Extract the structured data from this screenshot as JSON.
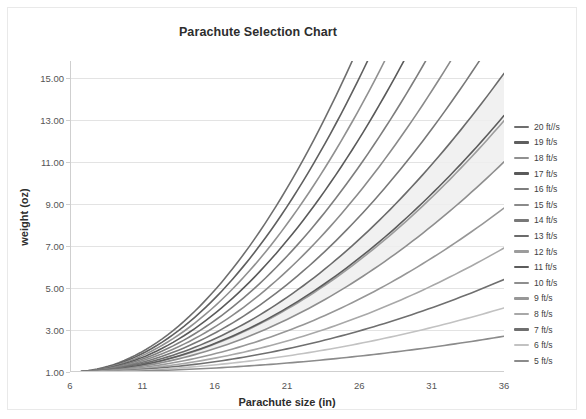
{
  "chart": {
    "title": "Parachute Selection Chart",
    "xlabel": "Parachute size (in)",
    "ylabel": "weight (oz)"
  },
  "chart_data": {
    "type": "line",
    "title": "Parachute Selection Chart",
    "subtitle": "",
    "xlabel": "Parachute size (in)",
    "ylabel": "weight (oz)",
    "xlim": [
      6,
      36
    ],
    "ylim": [
      1.0,
      15.8
    ],
    "xticks": [
      6,
      11,
      16,
      21,
      26,
      31,
      36
    ],
    "xtick_labels": [
      "6",
      "11",
      "16",
      "21",
      "26",
      "31",
      "36"
    ],
    "yticks": [
      1.0,
      3.0,
      5.0,
      7.0,
      9.0,
      11.0,
      13.0,
      15.0
    ],
    "ytick_labels": [
      "1.00",
      "3.00",
      "5.00",
      "7.00",
      "9.00",
      "11.00",
      "13.00",
      "15.00"
    ],
    "grid": "horizontal",
    "legend_position": "right",
    "annotations": [
      {
        "type": "shaded-band",
        "label": "recommended range",
        "color": "#efefef"
      }
    ],
    "x": [
      6,
      8,
      10,
      12,
      14,
      16,
      18,
      20,
      22,
      24,
      26,
      28,
      30,
      32,
      34,
      36
    ],
    "series": [
      {
        "name": "20 ft//s",
        "color": "#6e6e6e",
        "endpoint_y": 36.0,
        "values": [
          1.0,
          1.78,
          2.78,
          4.0,
          5.44,
          7.11,
          9.0,
          11.11,
          13.44,
          16.0,
          18.78,
          21.78,
          25.0,
          28.44,
          32.11,
          36.0
        ]
      },
      {
        "name": "19 ft/s",
        "color": "#5f5f5f",
        "endpoint_y": 32.49,
        "values": [
          1.0,
          1.78,
          2.78,
          4.0,
          5.44,
          7.11,
          9.0,
          11.11,
          13.44,
          16.0,
          18.78,
          21.78,
          25.0,
          28.44,
          32.11,
          36.0
        ]
      },
      {
        "name": "18 ft/s",
        "color": "#909090",
        "endpoint_y": 29.16,
        "values": [
          1.0,
          1.78,
          2.78,
          4.0,
          5.44,
          7.11,
          9.0,
          11.11,
          13.44,
          16.0,
          18.78,
          21.78,
          25.0,
          28.44,
          32.11,
          36.0
        ]
      },
      {
        "name": "17 ft/s",
        "color": "#5a5a5a",
        "endpoint_y": 26.01,
        "values": [
          1.0,
          1.78,
          2.78,
          4.0,
          5.44,
          7.11,
          9.0,
          11.11,
          13.44,
          16.0,
          18.78,
          21.78,
          25.0,
          28.44,
          32.11,
          36.0
        ]
      },
      {
        "name": "16 ft/s",
        "color": "#7d7d7d",
        "endpoint_y": 23.04,
        "values": [
          1.0,
          1.78,
          2.78,
          4.0,
          5.44,
          7.11,
          9.0,
          11.11,
          13.44,
          16.0,
          18.78,
          21.78,
          25.0,
          28.44,
          32.11,
          36.0
        ]
      },
      {
        "name": "15 ft/s",
        "color": "#8a8a8a",
        "endpoint_y": 20.25,
        "values": [
          1.0,
          1.78,
          2.78,
          4.0,
          5.44,
          7.11,
          9.0,
          11.11,
          13.44,
          16.0,
          18.78,
          21.78,
          25.0,
          28.44,
          32.11,
          36.0
        ]
      },
      {
        "name": "14 ft/s",
        "color": "#787878",
        "endpoint_y": 17.64,
        "values": [
          1.0,
          1.78,
          2.78,
          4.0,
          5.44,
          7.11,
          9.0,
          11.11,
          13.44,
          16.0,
          18.78,
          21.78,
          25.0,
          28.44,
          32.11,
          36.0
        ]
      },
      {
        "name": "13 ft/s",
        "color": "#6b6b6b",
        "endpoint_y": 15.21,
        "values": [
          1.0,
          1.78,
          2.78,
          4.0,
          5.44,
          7.11,
          9.0,
          11.11,
          13.44,
          16.0,
          18.78,
          21.78,
          25.0,
          28.44,
          32.11,
          36.0
        ]
      },
      {
        "name": "12 ft/s",
        "color": "#9c9c9c",
        "endpoint_y": 12.96,
        "values": [
          1.0,
          1.72,
          2.69,
          3.88,
          5.28,
          6.9,
          8.74,
          10.79,
          13.06,
          15.54,
          18.24,
          21.16,
          24.29,
          27.64,
          31.21,
          34.99
        ]
      },
      {
        "name": "11 ft/s",
        "color": "#5c5c5c",
        "endpoint_y": 13.2,
        "values": [
          1.0,
          1.64,
          2.5,
          3.56,
          4.83,
          6.31,
          8.0,
          9.89,
          12.0,
          14.31,
          16.83,
          19.56,
          22.5,
          25.64,
          29.0,
          32.56
        ]
      },
      {
        "name": "10 ft/s",
        "color": "#8e8e8e",
        "endpoint_y": 11.0,
        "values": [
          1.0,
          1.56,
          2.28,
          3.15,
          4.17,
          5.36,
          6.7,
          8.2,
          9.86,
          11.67,
          13.64,
          15.77,
          18.06,
          20.5,
          23.1,
          25.86
        ]
      },
      {
        "name": "9 ft/s",
        "color": "#979797",
        "endpoint_y": 8.8,
        "values": [
          1.0,
          1.48,
          2.08,
          2.8,
          3.64,
          4.6,
          5.68,
          6.88,
          8.2,
          9.64,
          11.2,
          12.88,
          14.68,
          16.6,
          18.64,
          20.8
        ]
      },
      {
        "name": "8 ft/s",
        "color": "#a8a8a8",
        "endpoint_y": 6.9,
        "values": [
          1.0,
          1.4,
          1.88,
          2.45,
          3.1,
          3.84,
          4.66,
          5.56,
          6.55,
          7.62,
          8.78,
          10.02,
          11.35,
          12.76,
          14.26,
          15.84
        ]
      },
      {
        "name": "7 ft/s",
        "color": "#6f6f6f",
        "endpoint_y": 5.4,
        "values": [
          1.0,
          1.32,
          1.7,
          2.14,
          2.64,
          3.2,
          3.82,
          4.5,
          5.24,
          6.04,
          6.9,
          7.82,
          8.8,
          9.84,
          10.94,
          12.1
        ]
      },
      {
        "name": "6 ft/s",
        "color": "#c2c2c2",
        "endpoint_y": 4.05,
        "values": [
          1.0,
          1.25,
          1.53,
          1.86,
          2.22,
          2.62,
          3.06,
          3.54,
          4.06,
          4.62,
          5.22,
          5.86,
          6.54,
          7.26,
          8.02,
          8.82
        ]
      },
      {
        "name": "5 ft/s",
        "color": "#8b8b8b",
        "endpoint_y": 2.7,
        "values": [
          1.0,
          1.18,
          1.39,
          1.62,
          1.88,
          2.17,
          2.48,
          2.82,
          3.19,
          3.58,
          4.0,
          4.45,
          4.92,
          5.42,
          5.95,
          6.5
        ]
      }
    ]
  }
}
